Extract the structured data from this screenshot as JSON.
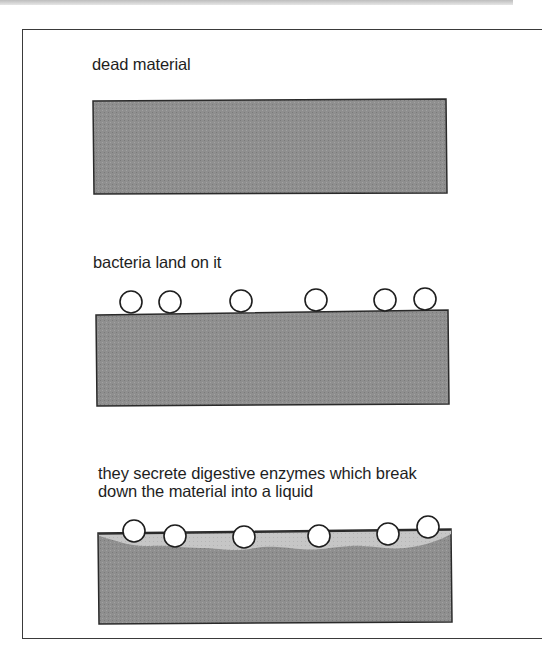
{
  "figure": {
    "panels": [
      {
        "caption": "dead material",
        "stage": "intact"
      },
      {
        "caption": "bacteria land on it",
        "stage": "bacteria-attached",
        "bacteria_count": 6
      },
      {
        "caption_line1": "they secrete digestive enzymes which break",
        "caption_line2": "down the material into a liquid",
        "stage": "digestion",
        "bacteria_count": 6
      }
    ],
    "colors": {
      "material": "#8f8f8f",
      "liquid": "#c8c8c8",
      "outline": "#2a2a2a",
      "bacterium_fill": "#ffffff"
    }
  }
}
